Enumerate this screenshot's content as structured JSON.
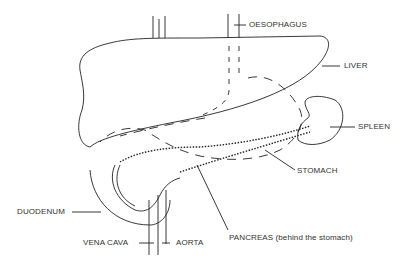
{
  "diagram": {
    "labels": {
      "oesophagus": "OESOPHAGUS",
      "liver": "LIVER",
      "spleen": "SPLEEN",
      "stomach": "STOMACH",
      "duodenum": "DUODENUM",
      "vena_cava": "VENA CAVA",
      "aorta": "AORTA",
      "pancreas": "PANCREAS (behind the stomach)"
    },
    "line_color": "#222222"
  }
}
